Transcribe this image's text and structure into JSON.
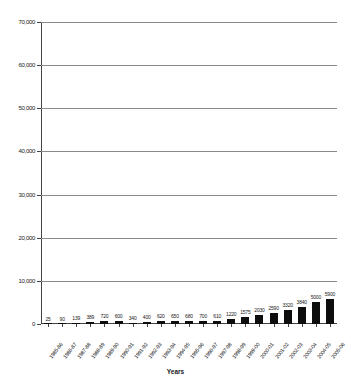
{
  "chart_data": {
    "type": "bar",
    "title": "",
    "xlabel": "Years",
    "ylabel": "",
    "ylim": [
      0,
      70000
    ],
    "ytick_step": 10000,
    "grid": true,
    "legend": "none",
    "bar_color": "#0d0d0d",
    "gridline_color": "#8a8a8a",
    "axis_color": "#444444",
    "ytick_labels": [
      "70,000",
      "60,000",
      "50,000",
      "40,000",
      "30,000",
      "20,000",
      "10,000",
      "0"
    ],
    "ytick_values": [
      70000,
      60000,
      50000,
      40000,
      30000,
      20000,
      10000,
      0
    ],
    "categories": [
      "1985-86",
      "1986-87",
      "1987-88",
      "1988-89",
      "1989-90",
      "1990-91",
      "1991-92",
      "1992-93",
      "1993-94",
      "1994-95",
      "1995-96",
      "1996-97",
      "1997-98",
      "1998-99",
      "1999-00",
      "2000-01",
      "2001-02",
      "2002-03",
      "2003-04",
      "2004-05",
      "2005-06"
    ],
    "values": [
      25,
      90,
      139,
      389,
      720,
      600,
      340,
      400,
      620,
      650,
      680,
      700,
      610,
      1220,
      1575,
      2030,
      2590,
      3320,
      3840,
      5000,
      5900
    ],
    "value_labels": [
      "25",
      "90",
      "139",
      "389",
      "720",
      "600",
      "340",
      "400",
      "620",
      "650",
      "680",
      "700",
      "610",
      "1220",
      "1575",
      "2030",
      "2590",
      "3320",
      "3840",
      "5000",
      "5900"
    ]
  }
}
